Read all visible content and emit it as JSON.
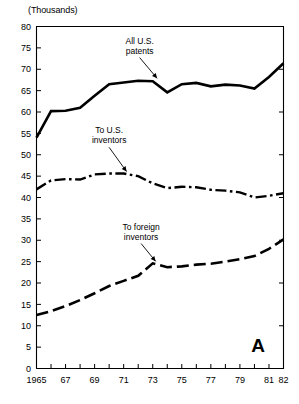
{
  "figure": {
    "panel_letter": "A",
    "units_label": "(Thousands)",
    "background_color": "#ffffff",
    "line_color": "#000000"
  },
  "annotations": [
    {
      "name": "all-us-patents",
      "line1": "All U.S.",
      "line2": "patents",
      "x": 1972.1,
      "y": 76.0,
      "target_x": 1973.3,
      "target_y": 67.4
    },
    {
      "name": "to-us-inventors",
      "line1": "To U.S.",
      "line2": "inventors",
      "x": 1970.0,
      "y": 55.0,
      "target_x": 1971.2,
      "target_y": 45.6
    },
    {
      "name": "to-foreign-inventors",
      "line1": "To foreign",
      "line2": "inventors",
      "x": 1972.2,
      "y": 32.5,
      "target_x": 1973.2,
      "target_y": 24.6
    }
  ],
  "chart_data": {
    "type": "line",
    "title": "",
    "subtitle": "",
    "xlabel": "",
    "ylabel": "(Thousands)",
    "xlim": [
      1965,
      1982
    ],
    "ylim": [
      0,
      80
    ],
    "yticks": [
      0,
      5,
      10,
      15,
      20,
      25,
      30,
      35,
      40,
      45,
      50,
      55,
      60,
      65,
      70,
      75,
      80
    ],
    "ytick_labels": [
      "0",
      "5",
      "10",
      "15",
      "20",
      "25",
      "30",
      "35",
      "40",
      "45",
      "50",
      "55",
      "60",
      "65",
      "70",
      "75",
      "80"
    ],
    "xticks": [
      1965,
      1966,
      1967,
      1968,
      1969,
      1970,
      1971,
      1972,
      1973,
      1974,
      1975,
      1976,
      1977,
      1978,
      1979,
      1980,
      1981,
      1982
    ],
    "xtick_labels": [
      "1965",
      "",
      "67",
      "",
      "69",
      "",
      "71",
      "",
      "73",
      "",
      "75",
      "",
      "77",
      "",
      "79",
      "",
      "81",
      "82"
    ],
    "grid": false,
    "legend": "inline-annotations",
    "x": [
      1965,
      1966,
      1967,
      1968,
      1969,
      1970,
      1971,
      1972,
      1973,
      1974,
      1975,
      1976,
      1977,
      1978,
      1979,
      1980,
      1981,
      1982
    ],
    "series": [
      {
        "name": "All U.S. patents",
        "style": "solid",
        "width": 2.6,
        "values": [
          54.0,
          60.2,
          60.3,
          61.0,
          63.8,
          66.5,
          66.9,
          67.3,
          67.2,
          64.6,
          66.5,
          66.8,
          66.0,
          66.4,
          66.2,
          65.5,
          68.2,
          71.4
        ]
      },
      {
        "name": "To U.S. inventors",
        "style": "dashdot",
        "width": 2.4,
        "values": [
          41.9,
          44.0,
          44.3,
          44.2,
          45.4,
          45.6,
          45.6,
          45.0,
          43.3,
          42.2,
          42.5,
          42.4,
          41.8,
          41.6,
          41.2,
          40.0,
          40.4,
          41.0
        ]
      },
      {
        "name": "To foreign inventors",
        "style": "dashed",
        "width": 2.6,
        "values": [
          12.5,
          13.4,
          14.6,
          16.0,
          17.6,
          19.3,
          20.5,
          21.7,
          24.6,
          23.7,
          23.9,
          24.3,
          24.5,
          25.0,
          25.6,
          26.3,
          28.0,
          30.2
        ]
      }
    ]
  }
}
